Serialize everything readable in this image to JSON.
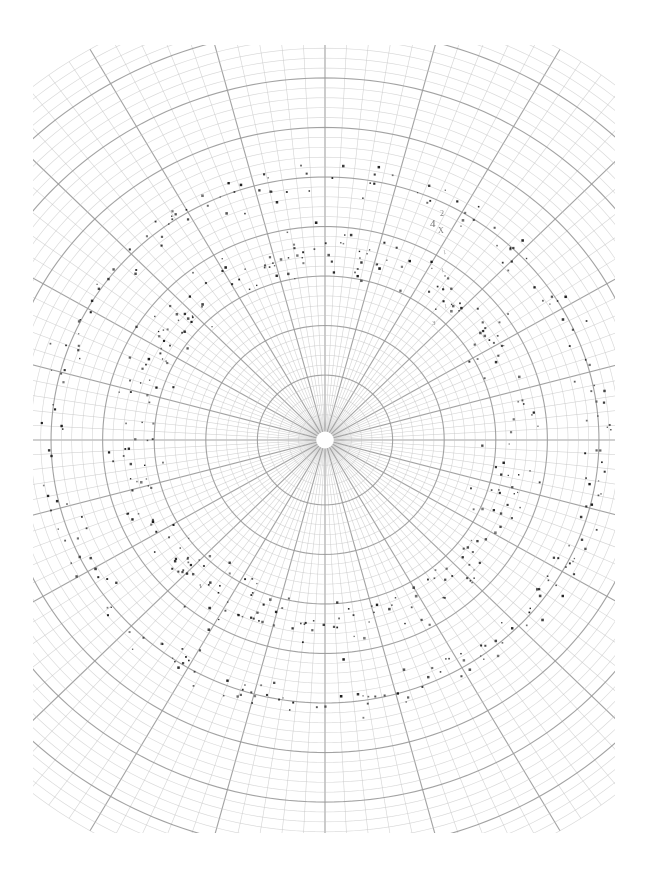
{
  "figure": {
    "kind": "polar-grid-scatter",
    "background_color": "#ffffff",
    "width": 646,
    "height": 884
  },
  "chart_data": {
    "type": "scatter",
    "title": "",
    "subtitle": "",
    "xlabel": "",
    "ylabel": "",
    "projection": "polar",
    "grid": true,
    "legend": null,
    "legend_position": "none",
    "axis_tick_labels": [],
    "center_px": [
      325,
      440
    ],
    "plot_bounds_px": {
      "left": 33,
      "top": 45,
      "right": 615,
      "bottom": 833
    },
    "grid_style": {
      "minor_color": "#c4c4c4",
      "major_color": "#9a9a9a",
      "minor_width": 0.6,
      "major_width": 1.1,
      "radial_spokes_total": 120,
      "radial_spokes_major_every": 5,
      "arcs_total": 44,
      "arcs_major_every": 5,
      "radius_min_px": 16,
      "radius_max_px": 470,
      "radial_spacing_mode": "linear",
      "aspect_x": 1.0,
      "aspect_y": 0.96
    },
    "point_style": {
      "color": "#1a1a1a",
      "marker": "square",
      "size_px_min": 1.2,
      "size_px_max": 2.6
    },
    "series": [
      {
        "name": "inner-band",
        "description": "dense annular cluster of dark square markers",
        "radius_range_px": [
          150,
          235
        ],
        "count": 300
      },
      {
        "name": "outer-band",
        "description": "sparser annular cluster of dark square markers",
        "radius_range_px": [
          245,
          300
        ],
        "count": 230
      }
    ]
  },
  "annotations": [
    {
      "id": "ann-4",
      "text": "4",
      "x": 430,
      "y": 218,
      "size": 11,
      "opacity": 0.78,
      "rotate": 0
    },
    {
      "id": "ann-2",
      "text": "2",
      "x": 440,
      "y": 210,
      "size": 8,
      "opacity": 0.7,
      "rotate": 0
    },
    {
      "id": "ann-x",
      "text": "X",
      "x": 438,
      "y": 227,
      "size": 8,
      "opacity": 0.72,
      "rotate": 0
    },
    {
      "id": "ann-1a",
      "text": "1",
      "x": 443,
      "y": 249,
      "size": 6,
      "opacity": 0.55,
      "rotate": -12
    },
    {
      "id": "ann-1b",
      "text": "1",
      "x": 441,
      "y": 267,
      "size": 6,
      "opacity": 0.52,
      "rotate": -12
    },
    {
      "id": "ann-1c",
      "text": "1",
      "x": 442,
      "y": 285,
      "size": 6,
      "opacity": 0.5,
      "rotate": -12
    },
    {
      "id": "ann-1d",
      "text": "1",
      "x": 444,
      "y": 303,
      "size": 6,
      "opacity": 0.5,
      "rotate": -12
    },
    {
      "id": "ann-3",
      "text": "3",
      "x": 432,
      "y": 320,
      "size": 7,
      "opacity": 0.6,
      "rotate": 0
    }
  ]
}
